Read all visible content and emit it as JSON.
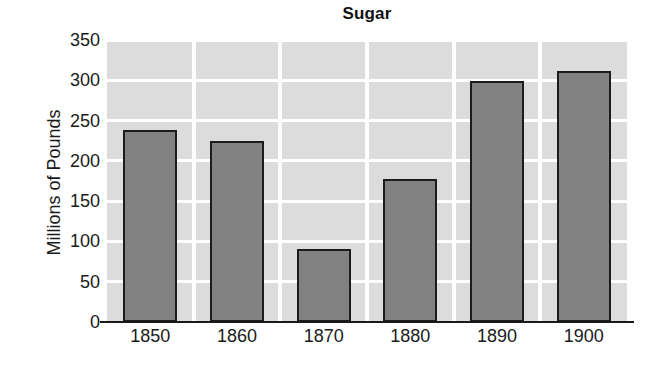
{
  "chart_data": {
    "type": "bar",
    "title": "Sugar",
    "xlabel": "",
    "ylabel": "Millions of Pounds",
    "categories": [
      "1850",
      "1860",
      "1870",
      "1880",
      "1890",
      "1900"
    ],
    "values": [
      238,
      225,
      90,
      177,
      299,
      312
    ],
    "ylim": [
      0,
      350
    ],
    "yticks": [
      0,
      50,
      100,
      150,
      200,
      250,
      300,
      350
    ],
    "ytick_labels": [
      "0",
      "50",
      "100",
      "150",
      "200",
      "250",
      "300",
      "350"
    ],
    "grid": "horizontal-and-vertical",
    "legend": "none",
    "series": [
      {
        "name": "Sugar",
        "values": [
          238,
          225,
          90,
          177,
          299,
          312
        ]
      }
    ],
    "colors": {
      "bar_fill": "#828282",
      "bar_border": "#1c1c1c",
      "plot_background": "#dcdcdc",
      "gridline": "#ffffff",
      "text": "#1a1a1a",
      "page_background": "#ffffff"
    }
  }
}
